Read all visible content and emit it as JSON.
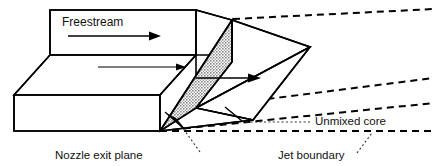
{
  "figure": {
    "background_color": "#ffffff",
    "line_color": "#000000",
    "shaded_face_color": "#b3b3b3",
    "width": 434,
    "height": 166
  },
  "labels": {
    "freestream": "Freestream",
    "nozzle_exit_plane": "Nozzle exit plane",
    "unmixed_core": "Unmixed core",
    "jet_boundary": "Jet boundary"
  },
  "annotations": [
    {
      "id": "freestream",
      "text": "Freestream",
      "x": 62,
      "y": 26,
      "anchor": "start",
      "has_arrow": true,
      "arrow_description": "horizontal right-pointing flow arrow beneath text"
    },
    {
      "id": "nozzle-exit-plane",
      "text": "Nozzle exit plane",
      "x": 55,
      "y": 159,
      "anchor": "start",
      "has_leader": true,
      "leader_description": "dotted leader rising to arrowhead on shaded exit plane"
    },
    {
      "id": "unmixed-core",
      "text": "Unmixed core",
      "x": 315,
      "y": 125,
      "anchor": "start",
      "has_leader": true,
      "leader_description": "dotted leader to arrowhead on inner core edge"
    },
    {
      "id": "jet-boundary",
      "text": "Jet boundary",
      "x": 278,
      "y": 159,
      "anchor": "start",
      "has_leader": true,
      "leader_description": "dotted leader rising to lower dashed jet boundary line"
    }
  ],
  "geometry": {
    "slab_top_face": "158,10 232,20 232,55 196,55 196,29 50,29 50,10",
    "slab_front_face": "14,95 14,131 160,131 160,95",
    "slab_left_bevel": "50,29 14,95 160,95 196,29",
    "upper_block": "50,10 196,10 196,55 232,55",
    "exit_plane_shaded": "160,131 232,20 232,62 196,108",
    "core_upper_triangle": "232,20 310,47 196,108",
    "core_lower_triangle": "196,108 310,47 253,120",
    "jet_lower_face": "160,131 253,120 310,47",
    "jet_boundary_top": "232,20 433,10",
    "jet_boundary_mid": "196,108 433,78",
    "jet_boundary_low": "160,131 433,103",
    "jet_boundary_bottom_dash": "160,131 433,131"
  },
  "flow_arrows": [
    {
      "id": "freestream-arrow",
      "x1": 68,
      "y1": 36,
      "x2": 156,
      "y2": 36
    },
    {
      "id": "mid-upper-arrow",
      "x1": 98,
      "y1": 67,
      "x2": 200,
      "y2": 67
    },
    {
      "id": "jet-core-arrow",
      "x1": 196,
      "y1": 78,
      "x2": 258,
      "y2": 78
    }
  ]
}
